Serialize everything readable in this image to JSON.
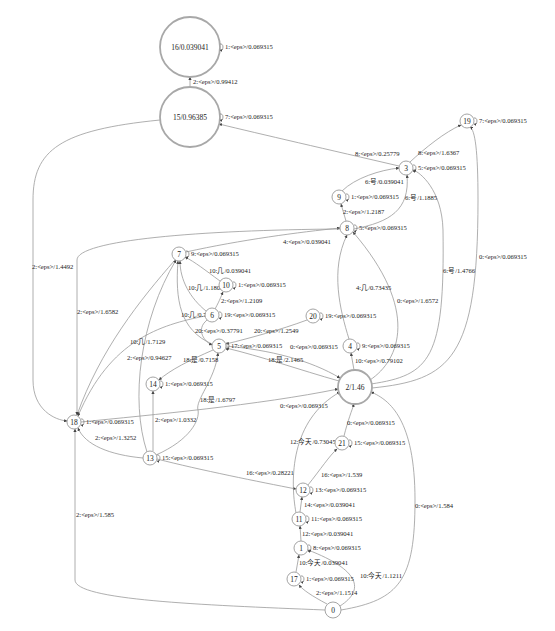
{
  "graph": {
    "type": "weighted-fst",
    "nodes": [
      {
        "id": "16",
        "label": "16/0.039041",
        "x": 190,
        "y": 47,
        "r": 30,
        "final": true
      },
      {
        "id": "15",
        "label": "15/0.96385",
        "x": 190,
        "y": 117,
        "r": 30,
        "final": true
      },
      {
        "id": "19",
        "label": "19",
        "x": 467,
        "y": 121,
        "r": 7,
        "final": false
      },
      {
        "id": "3",
        "label": "3",
        "x": 406,
        "y": 168,
        "r": 7,
        "final": false
      },
      {
        "id": "9",
        "label": "9",
        "x": 339,
        "y": 197,
        "r": 7,
        "final": false
      },
      {
        "id": "8",
        "label": "8",
        "x": 347,
        "y": 228,
        "r": 7,
        "final": false
      },
      {
        "id": "7",
        "label": "7",
        "x": 179,
        "y": 254,
        "r": 7,
        "final": false
      },
      {
        "id": "10",
        "label": "10",
        "x": 226,
        "y": 285,
        "r": 7,
        "final": false
      },
      {
        "id": "6",
        "label": "6",
        "x": 212,
        "y": 315,
        "r": 7,
        "final": false
      },
      {
        "id": "20",
        "label": "20",
        "x": 313,
        "y": 316,
        "r": 7,
        "final": false
      },
      {
        "id": "5",
        "label": "5",
        "x": 219,
        "y": 346,
        "r": 7,
        "final": false
      },
      {
        "id": "4",
        "label": "4",
        "x": 350,
        "y": 346,
        "r": 7,
        "final": false
      },
      {
        "id": "2",
        "label": "2/1.46",
        "x": 355,
        "y": 387,
        "r": 17,
        "final": true
      },
      {
        "id": "14",
        "label": "14",
        "x": 153,
        "y": 384,
        "r": 7,
        "final": false
      },
      {
        "id": "18",
        "label": "18",
        "x": 74,
        "y": 422,
        "r": 7,
        "final": false
      },
      {
        "id": "13",
        "label": "13",
        "x": 150,
        "y": 458,
        "r": 7,
        "final": false
      },
      {
        "id": "21",
        "label": "21",
        "x": 342,
        "y": 443,
        "r": 7,
        "final": false
      },
      {
        "id": "12",
        "label": "12",
        "x": 303,
        "y": 490,
        "r": 7,
        "final": false
      },
      {
        "id": "11",
        "label": "11",
        "x": 299,
        "y": 519,
        "r": 7,
        "final": false
      },
      {
        "id": "1",
        "label": "1",
        "x": 301,
        "y": 548,
        "r": 7,
        "final": false
      },
      {
        "id": "17",
        "label": "17",
        "x": 294,
        "y": 579,
        "r": 7,
        "final": false
      },
      {
        "id": "0",
        "label": "0",
        "x": 333,
        "y": 610,
        "r": 8,
        "final": false
      }
    ],
    "self_loops": [
      {
        "node": "16",
        "label": "1:<eps>/0.069315"
      },
      {
        "node": "15",
        "label": "7:<eps>/0.069315"
      },
      {
        "node": "19",
        "label": "7:<eps>/0.069315"
      },
      {
        "node": "3",
        "label": "5:<eps>/0.069315"
      },
      {
        "node": "9",
        "label": "1:<eps>/0.069315"
      },
      {
        "node": "8",
        "label": "5:<eps>/0.069315"
      },
      {
        "node": "7",
        "label": "9:<eps>/0.069315"
      },
      {
        "node": "10",
        "label": "1:<eps>/0.069315"
      },
      {
        "node": "6",
        "label": "19:<eps>/0.069315"
      },
      {
        "node": "20",
        "label": "19:<eps>/0.069315"
      },
      {
        "node": "5",
        "label": "17:<eps>/0.069315"
      },
      {
        "node": "4",
        "label": "9:<eps>/0.069315"
      },
      {
        "node": "14",
        "label": "1:<eps>/0.069315"
      },
      {
        "node": "18",
        "label": "1:<eps>/0.069315"
      },
      {
        "node": "13",
        "label": "15:<eps>/0.069315"
      },
      {
        "node": "21",
        "label": "15:<eps>/0.069315"
      },
      {
        "node": "12",
        "label": "13:<eps>/0.069315"
      },
      {
        "node": "11",
        "label": "11:<eps>/0.069315"
      },
      {
        "node": "1",
        "label": "8:<eps>/0.069315"
      },
      {
        "node": "17",
        "label": "1:<eps>/0.069315"
      }
    ],
    "edges": [
      {
        "from": "15",
        "to": "16",
        "label": "2:<eps>/0.99412",
        "path": "M190,87 L190,77",
        "lx": 193,
        "ly": 84
      },
      {
        "from": "3",
        "to": "15",
        "label": "8:<eps>/0.25779",
        "path": "M399,166 C330,150 260,134 219,124",
        "lx": 355,
        "ly": 156
      },
      {
        "from": "3",
        "to": "19",
        "label": "8:<eps>/1.6367",
        "path": "M410,162 C425,148 445,132 461,125",
        "lx": 418,
        "ly": 155
      },
      {
        "from": "9",
        "to": "3",
        "label": "6:号/0.039041",
        "path": "M342,191 C355,178 380,170 399,168",
        "lx": 365,
        "ly": 184
      },
      {
        "from": "8",
        "to": "3",
        "label": "6:号/1.1885",
        "path": "M354,229 C390,222 410,210 407,175",
        "lx": 405,
        "ly": 200
      },
      {
        "from": "8",
        "to": "9",
        "label": "2:<eps>/1.2187",
        "path": "M346,221 L341,204",
        "lx": 343,
        "ly": 214
      },
      {
        "from": "7",
        "to": "8",
        "label": "4:<eps>/0.039041",
        "path": "M186,252 C240,240 300,232 340,228",
        "lx": 283,
        "ly": 244
      },
      {
        "from": "10",
        "to": "7",
        "label": "10:几/0.039041",
        "path": "M220,281 C205,270 195,262 185,257",
        "lx": 209,
        "ly": 273
      },
      {
        "from": "6",
        "to": "7",
        "label": "10:几/1.1806",
        "path": "M206,311 C190,298 180,280 180,261",
        "lx": 188,
        "ly": 290
      },
      {
        "from": "6",
        "to": "10",
        "label": "2:<eps>/1.2109",
        "path": "M215,309 C220,300 222,294 223,292",
        "lx": 221,
        "ly": 303
      },
      {
        "from": "5",
        "to": "7",
        "label": "10:几/0.749",
        "path": "M212,344 C180,330 175,300 178,261",
        "lx": 181,
        "ly": 317
      },
      {
        "from": "6",
        "to": "5",
        "label": "20:<eps>/0.37791",
        "path": "M207,320 C195,330 205,342 212,345",
        "lx": 195,
        "ly": 333
      },
      {
        "from": "20",
        "to": "5",
        "label": "20:<eps>/1.2549",
        "path": "M307,320 C280,330 250,338 226,344",
        "lx": 254,
        "ly": 333
      },
      {
        "from": "2",
        "to": "5",
        "label": "18:是/2.1465",
        "path": "M339,381 C300,370 260,356 226,348",
        "lx": 268,
        "ly": 362
      },
      {
        "from": "5",
        "to": "14",
        "label": "18:是/0.7158",
        "path": "M213,350 C190,360 170,370 159,380",
        "lx": 183,
        "ly": 362
      },
      {
        "from": "13",
        "to": "5",
        "label": "18:是/1.6797",
        "path": "M156,455 C190,440 200,420 198,410 C195,400 215,380 218,353",
        "lx": 200,
        "ly": 402
      },
      {
        "from": "4",
        "to": "8",
        "label": "4:几/0.73435",
        "path": "M349,339 C340,310 330,270 347,235",
        "lx": 356,
        "ly": 290
      },
      {
        "from": "2",
        "to": "8",
        "label": "0:<eps>/1.6572",
        "path": "M370,380 C400,360 420,310 353,232",
        "lx": 397,
        "ly": 303
      },
      {
        "from": "2",
        "to": "3",
        "label": "6:号/1.4766",
        "path": "M371,384 C430,375 445,360 443,230 C442,190 420,172 413,170",
        "lx": 443,
        "ly": 273
      },
      {
        "from": "2",
        "to": "19",
        "label": "0:<eps>/0.069315",
        "path": "M372,388 C450,380 478,360 478,200 C478,150 475,130 470,127",
        "lx": 479,
        "ly": 259
      },
      {
        "from": "2",
        "to": "4",
        "label": "10:<eps>/0.79102",
        "path": "M354,370 L351,353",
        "lx": 355,
        "ly": 363
      },
      {
        "from": "5",
        "to": "2",
        "label": "0:<eps>/0.069315",
        "path": "M226,346 C270,350 310,360 340,378",
        "lx": 290,
        "ly": 349
      },
      {
        "from": "18",
        "to": "2",
        "label": "0:<eps>/0.069315",
        "path": "M81,422 C150,415 260,405 338,389",
        "lx": 280,
        "ly": 408
      },
      {
        "from": "21",
        "to": "2",
        "label": "0:<eps>/0.069315",
        "path": "M344,436 C348,420 352,410 354,404",
        "lx": 347,
        "ly": 425
      },
      {
        "from": "0",
        "to": "2",
        "label": "0:<eps>/1.584",
        "path": "M341,610 C400,600 415,580 415,500 C415,420 390,400 371,392",
        "lx": 415,
        "ly": 508
      },
      {
        "from": "15",
        "to": "18",
        "label": "2:<eps>/1.4492",
        "path": "M160,120 C60,130 33,150 33,200 L33,380 C33,410 55,420 67,421",
        "lx": 32,
        "ly": 269
      },
      {
        "from": "8",
        "to": "18",
        "label": "2:<eps>/1.6582",
        "path": "M340,229 C200,230 77,240 77,260 L77,415",
        "lx": 77,
        "ly": 314
      },
      {
        "from": "7",
        "to": "18",
        "label": "10:几/1.7129",
        "path": "M175,260 C140,300 100,350 77,415",
        "lx": 130,
        "ly": 344
      },
      {
        "from": "6",
        "to": "18",
        "label": "2:<eps>/0.94627",
        "path": "M205,316 C160,325 110,340 78,416",
        "lx": 127,
        "ly": 360
      },
      {
        "from": "13",
        "to": "18",
        "label": "2:<eps>/1.3252",
        "path": "M143,458 C110,455 85,445 78,428",
        "lx": 95,
        "ly": 440
      },
      {
        "from": "0",
        "to": "18",
        "label": "2:<eps>/1.585",
        "path": "M325,610 C200,605 75,600 75,580 L75,429",
        "lx": 76,
        "ly": 517
      },
      {
        "from": "13",
        "to": "14",
        "label": "2:<eps>/1.0332",
        "path": "M153,451 L153,391",
        "lx": 155,
        "ly": 422
      },
      {
        "from": "13",
        "to": "7",
        "label": "10:几/1.7129-b",
        "path": "M147,452 C130,400 140,320 176,260",
        "lx": 0,
        "ly": 0,
        "hidden_label": true
      },
      {
        "from": "13",
        "to": "12",
        "label": "16:<eps>/0.28221",
        "path": "M157,459 C200,470 260,482 296,489",
        "lx": 246,
        "ly": 475
      },
      {
        "from": "12",
        "to": "21",
        "label": "16:<eps>/1.539",
        "path": "M308,485 C320,470 330,455 337,449",
        "lx": 321,
        "ly": 477
      },
      {
        "from": "11",
        "to": "2",
        "label": "12:今天/0.73045",
        "path": "M296,513 C290,480 290,420 340,392",
        "lx": 290,
        "ly": 444
      },
      {
        "from": "11",
        "to": "12",
        "label": "14:<eps>/0.039041",
        "path": "M300,512 L302,497",
        "lx": 304,
        "ly": 507
      },
      {
        "from": "1",
        "to": "11",
        "label": "12:<eps>/0.039041",
        "path": "M301,541 L300,526",
        "lx": 302,
        "ly": 536
      },
      {
        "from": "17",
        "to": "1",
        "label": "10:今天/0.039041",
        "path": "M296,572 L299,555",
        "lx": 299,
        "ly": 565
      },
      {
        "from": "0",
        "to": "1",
        "label": "10:今天/1.1211",
        "path": "M340,606 C365,590 360,570 308,550",
        "lx": 360,
        "ly": 578
      },
      {
        "from": "0",
        "to": "17",
        "label": "2:<eps>/1.1514",
        "path": "M327,604 C312,596 303,590 299,585",
        "lx": 316,
        "ly": 595
      }
    ]
  }
}
